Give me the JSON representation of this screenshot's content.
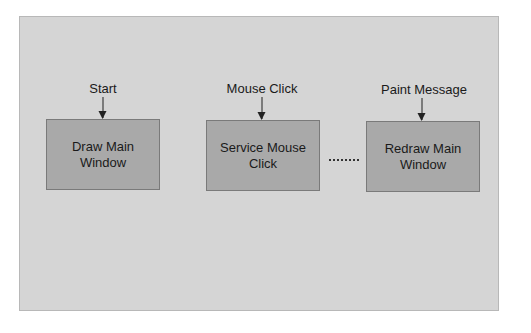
{
  "diagram": {
    "type": "flow",
    "nodes": [
      {
        "id": "draw",
        "label": "Draw Main Window",
        "trigger": "Start"
      },
      {
        "id": "service",
        "label": "Service Mouse Click",
        "trigger": "Mouse Click"
      },
      {
        "id": "redraw",
        "label": "Redraw Main Window",
        "trigger": "Paint Message"
      }
    ],
    "connector_between_service_and_redraw": "dotted",
    "colors": {
      "panel": "#d5d5d5",
      "box": "#a9a9a9",
      "text": "#1a1a1a"
    }
  }
}
